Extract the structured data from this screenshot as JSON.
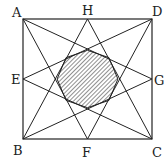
{
  "diagram": {
    "type": "geometry",
    "points": {
      "A": {
        "label": "A",
        "x": 23,
        "y": 19
      },
      "D": {
        "label": "D",
        "x": 152,
        "y": 19
      },
      "B": {
        "label": "B",
        "x": 23,
        "y": 139
      },
      "C": {
        "label": "C",
        "x": 152,
        "y": 139
      },
      "H": {
        "label": "H",
        "x": 87.5,
        "y": 19
      },
      "F": {
        "label": "F",
        "x": 87.5,
        "y": 139
      },
      "E": {
        "label": "E",
        "x": 23,
        "y": 79
      },
      "G": {
        "label": "G",
        "x": 152,
        "y": 79
      }
    },
    "segments": [
      [
        "A",
        "F"
      ],
      [
        "A",
        "G"
      ],
      [
        "D",
        "E"
      ],
      [
        "D",
        "F"
      ],
      [
        "B",
        "H"
      ],
      [
        "B",
        "G"
      ],
      [
        "C",
        "E"
      ],
      [
        "C",
        "H"
      ]
    ],
    "shaded_region": "central octagon (hatched)",
    "colors": {
      "line": "#222222",
      "hatch": "#222222",
      "background": "#ffffff"
    }
  }
}
